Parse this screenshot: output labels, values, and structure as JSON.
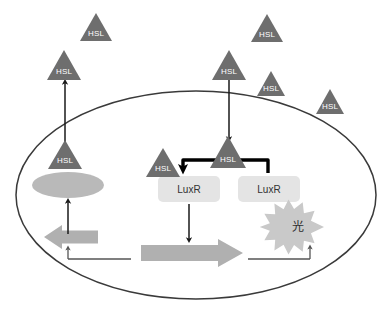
{
  "diagram": {
    "colors": {
      "hsl_fill": "#6e6e6e",
      "hsl_text": "#ffffff",
      "membrane_stroke": "#3a3a3a",
      "enzyme_fill": "#b9b9b9",
      "luxr_box_fill": "#e4e4e4",
      "luxr_text": "#333333",
      "gene_arrow_fill": "#b0b0b0",
      "light_burst_fill": "#c9c9c9",
      "light_text": "#2e2e2e",
      "bracket_stroke": "#000000",
      "thin_arrow_stroke": "#1a1a1a",
      "dna_line_stroke": "#555555",
      "background": "#ffffff"
    },
    "cell": {
      "name": "bacterial-cell",
      "shape": "ellipse",
      "cx": 196,
      "cy": 195,
      "rx": 180,
      "ry": 104
    },
    "hsl_molecules": [
      {
        "id": "hsl-extracellular-top-left",
        "label": "HSL",
        "cx": 96,
        "cy": 27,
        "size": 24,
        "location": "outside"
      },
      {
        "id": "hsl-extracellular-left",
        "label": "HSL",
        "cx": 64,
        "cy": 66,
        "size": 26,
        "location": "outside"
      },
      {
        "id": "hsl-extracellular-top-right",
        "label": "HSL",
        "cx": 267,
        "cy": 28,
        "size": 24,
        "location": "outside"
      },
      {
        "id": "hsl-extracellular-inflow",
        "label": "HSL",
        "cx": 229,
        "cy": 66,
        "size": 26,
        "location": "outside"
      },
      {
        "id": "hsl-extracellular-right",
        "label": "HSL",
        "cx": 271,
        "cy": 84,
        "size": 22,
        "location": "outside"
      },
      {
        "id": "hsl-extracellular-far-right",
        "label": "HSL",
        "cx": 330,
        "cy": 102,
        "size": 22,
        "location": "outside"
      },
      {
        "id": "hsl-intracellular-left",
        "label": "HSL",
        "cx": 65,
        "cy": 155,
        "size": 26,
        "location": "inside"
      },
      {
        "id": "hsl-bound-left-luxr",
        "label": "HSL",
        "cx": 163,
        "cy": 163,
        "size": 26,
        "location": "inside"
      },
      {
        "id": "hsl-bound-right-luxr",
        "label": "HSL",
        "cx": 228,
        "cy": 152,
        "size": 28,
        "location": "inside"
      }
    ],
    "enzyme": {
      "name": "luxi-enzyme",
      "label": "",
      "cx": 68,
      "cy": 185,
      "rx": 36,
      "ry": 13
    },
    "proteins": [
      {
        "id": "luxr-monomer-left",
        "label": "LuxR",
        "x": 158,
        "y": 176,
        "w": 62,
        "h": 26
      },
      {
        "id": "luxr-monomer-right",
        "label": "LuxR",
        "x": 238,
        "y": 176,
        "w": 62,
        "h": 26
      }
    ],
    "light_burst": {
      "name": "light-emission-burst",
      "label": "光",
      "cx": 298,
      "cy": 227,
      "r_outer": 26,
      "r_inner": 16,
      "points": 13
    },
    "gene_arrows": [
      {
        "id": "luxi-gene-arrow",
        "direction": "left",
        "x": 44,
        "y": 237,
        "w": 54,
        "h": 14
      },
      {
        "id": "luxr-target-gene-arrow",
        "direction": "right",
        "x": 141,
        "y": 243,
        "w": 100,
        "h": 18
      }
    ],
    "signal_arrows": [
      {
        "id": "hsl-export-arrow",
        "from": "hsl-intracellular-left",
        "to": "hsl-extracellular-left",
        "direction": "up",
        "x": 65,
        "y1": 142,
        "y2": 81
      },
      {
        "id": "hsl-import-arrow",
        "from": "hsl-extracellular-inflow",
        "to": "hsl-bound-right-luxr",
        "direction": "down",
        "x": 229,
        "y1": 80,
        "y2": 140
      },
      {
        "id": "luxi-synthesis-arrow",
        "from": "luxi-gene-arrow",
        "to": "luxi-enzyme",
        "direction": "up",
        "x": 68,
        "y1": 233,
        "y2": 200
      },
      {
        "id": "luxr-transcription-arrow",
        "from": "luxr-monomer-left",
        "to": "luxr-target-gene-arrow",
        "direction": "down",
        "x": 189,
        "y1": 204,
        "y2": 239
      }
    ],
    "dimer_bracket": {
      "name": "luxr-dimerization-bracket",
      "description": "thick bracket from right LuxR over to left LuxR with arrowhead",
      "left_x": 182,
      "right_x": 268,
      "top_y": 160,
      "bottom_left_y": 174,
      "bottom_right_y": 172
    },
    "dna_backbone": {
      "name": "dna-regulatory-line",
      "left_tick_x": 68,
      "right_tick_x": 310,
      "baseline_y": 259,
      "left_segment_end": 131,
      "right_segment_start": 248
    }
  }
}
